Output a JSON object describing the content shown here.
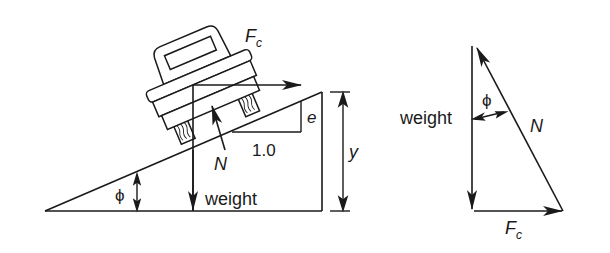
{
  "figure": {
    "type": "free-body diagram",
    "left_panel": {
      "description": "Car on banked incline",
      "labels": {
        "centripetal_force": "F",
        "centripetal_force_sub": "c",
        "normal_force": "N",
        "weight": "weight",
        "rise": "e",
        "run": "1.0",
        "height": "y",
        "angle": "ϕ"
      }
    },
    "right_panel": {
      "description": "Force triangle",
      "labels": {
        "weight": "weight",
        "angle": "ϕ",
        "normal_force": "N",
        "centripetal_force": "F",
        "centripetal_force_sub": "c"
      }
    }
  },
  "colors": {
    "stroke": "#1a1a1a",
    "background": "#ffffff"
  }
}
